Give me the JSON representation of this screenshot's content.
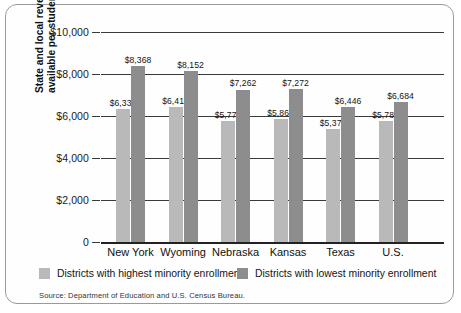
{
  "chart_data": {
    "type": "bar",
    "title": "",
    "xlabel": "",
    "ylabel": "State and local revenues available per student (2000)",
    "ylabel_line1": "State and local revenues",
    "ylabel_line2": "available per student (2000)",
    "ylim": [
      0,
      10000
    ],
    "ytick_labels": [
      "$10,000",
      "$8,000",
      "$6,000",
      "$4,000",
      "$2,000",
      "0"
    ],
    "ytick_values": [
      10000,
      8000,
      6000,
      4000,
      2000,
      0
    ],
    "grid": true,
    "legend_position": "bottom",
    "categories": [
      "New York",
      "Wyoming",
      "Nebraska",
      "Kansas",
      "Texas",
      "U.S."
    ],
    "series": [
      {
        "name": "Districts with highest minority enrollment",
        "color": "#b9b9b9",
        "values": [
          6335,
          6418,
          5777,
          5868,
          5378,
          5782
        ],
        "labels": [
          "$6,335",
          "$6,418",
          "$5,777",
          "$5,868",
          "$5,378",
          "$5,782"
        ]
      },
      {
        "name": "Districts with lowest minority enrollment",
        "color": "#8d8d8d",
        "values": [
          8368,
          8152,
          7262,
          7272,
          6446,
          6684
        ],
        "labels": [
          "$8,368",
          "$8,152",
          "$7,262",
          "$7,272",
          "$6,446",
          "$6,684"
        ]
      }
    ],
    "source": "Source: Department of Education and U.S. Census Bureau."
  }
}
